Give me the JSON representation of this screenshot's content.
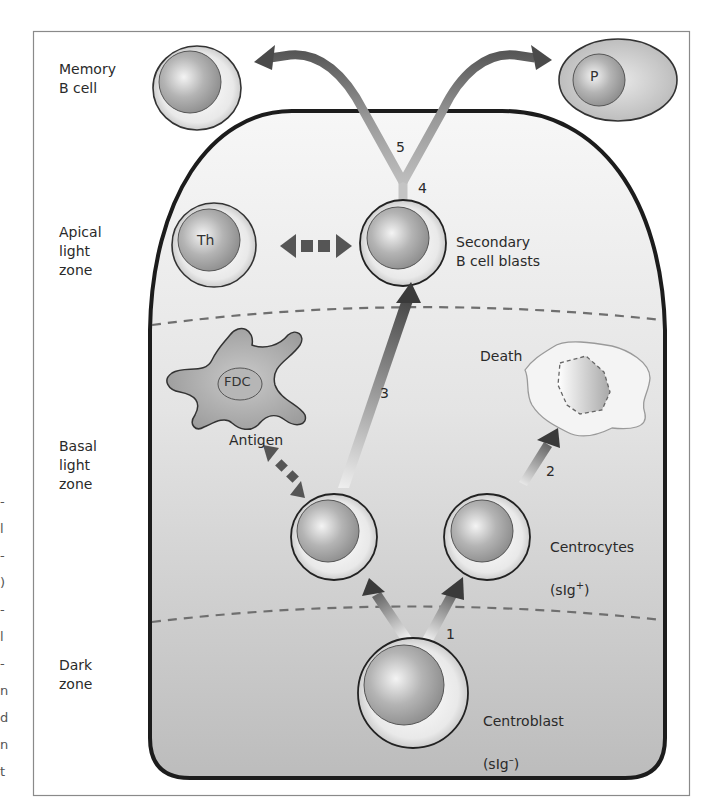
{
  "figure": {
    "zones": {
      "memory": "Memory\nB cell",
      "apical": "Apical\nlight\nzone",
      "basal": "Basal\nlight\nzone",
      "dark": "Dark\nzone"
    },
    "cells": {
      "th": "Th",
      "fdc": "FDC",
      "plasma": "P",
      "secondary": "Secondary\nB cell blasts",
      "centrocytes": "Centrocytes",
      "centrocytes_marker": "(sIg",
      "centrocytes_sup": "+",
      "centrocytes_close": ")",
      "centroblast": "Centroblast",
      "centroblast_marker": "(sIg",
      "centroblast_sup": "–",
      "centroblast_close": ")"
    },
    "annotations": {
      "antigen": "Antigen",
      "death": "Death"
    },
    "steps": [
      "1",
      "2",
      "3",
      "4",
      "5"
    ],
    "edge_fragments": [
      "-",
      "l",
      "-",
      ")",
      "-",
      "l",
      "-",
      "n",
      "d",
      "n",
      "t"
    ],
    "colors": {
      "frame": "#8a8a8a",
      "gc_outline": "#1c1c1c",
      "gc_fill_top": "#f6f6f6",
      "gc_fill_bottom": "#bdbdbd",
      "arrow_dark": "#3a3a3a",
      "dash": "#6f6f6f"
    }
  }
}
